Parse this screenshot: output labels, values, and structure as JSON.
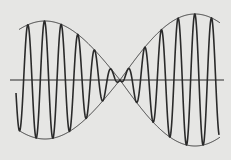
{
  "diagram": {
    "title": "",
    "colors": {
      "background": "#e6e6e4",
      "stroke": "#2a2a2a",
      "envelope": "#3a3a3a",
      "axis": "#2a2a2a"
    },
    "axis": {
      "y": 80,
      "x_start": 10,
      "x_end": 224
    },
    "envelope": {
      "x_start": 19,
      "x_end": 220,
      "node_x": 120,
      "half_period_px": 150,
      "left_amplitude_px": 59,
      "right_amplitude_px": 66
    },
    "carrier": {
      "x_start": 16,
      "x_end": 219,
      "period_px": 16.7,
      "phase_peak_x": 44.5
    }
  }
}
